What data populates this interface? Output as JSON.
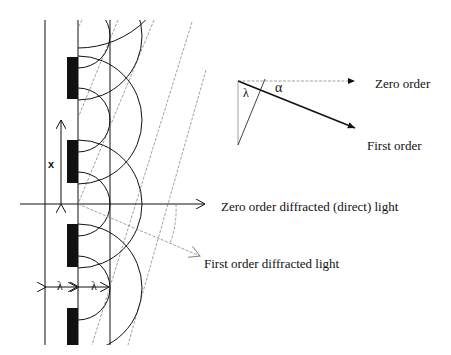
{
  "labels": {
    "zero_order_direct": "Zero order diffracted (direct) light",
    "first_order_diffracted": "First order diffracted light",
    "spacing_x": "x",
    "lambda_left": "λ",
    "lambda_right": "λ",
    "inset_zero_order": "Zero order",
    "inset_first_order": "First order",
    "inset_alpha": "α",
    "inset_lambda": "λ"
  },
  "geometry": {
    "grating_x": 78,
    "left_line_x": 45,
    "right_line_x": 110,
    "slab_width": 11,
    "slabs": [
      {
        "y1": 57,
        "y2": 99
      },
      {
        "y1": 140,
        "y2": 183
      },
      {
        "y1": 224,
        "y2": 267
      },
      {
        "y1": 308,
        "y2": 345
      }
    ],
    "slit_centers_y": [
      36,
      120,
      204,
      288
    ],
    "wavelength_px": 32,
    "axis_y": 204
  },
  "colors": {
    "ink": "#111111",
    "dashed": "#777777"
  }
}
